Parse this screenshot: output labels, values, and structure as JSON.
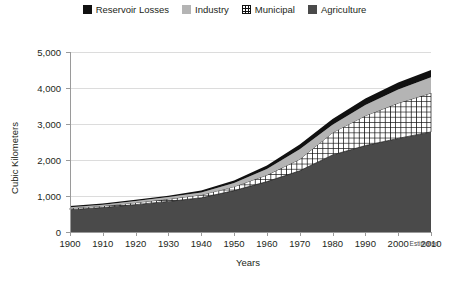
{
  "legend": {
    "position": "top-center",
    "items": [
      {
        "label": "Reservoir Losses",
        "icon": "square-swatch-black-icon",
        "color": "#111111",
        "pattern": "solid"
      },
      {
        "label": "Industry",
        "icon": "square-swatch-lightgray-icon",
        "color": "#b4b4b4",
        "pattern": "solid"
      },
      {
        "label": "Municipal",
        "icon": "square-swatch-crosshatch-icon",
        "color": "#ffffff",
        "pattern": "grid"
      },
      {
        "label": "Agriculture",
        "icon": "square-swatch-darkgray-icon",
        "color": "#4a4a4a",
        "pattern": "solid"
      }
    ]
  },
  "axes": {
    "x_title": "Years",
    "y_title": "Cubic Kilometers",
    "x_ticks": [
      "1900",
      "1910",
      "1920",
      "1930",
      "1940",
      "1950",
      "1960",
      "1970",
      "1980",
      "1990",
      "2000",
      "2010"
    ],
    "y_ticks": [
      "0",
      "1,000",
      "2,000",
      "3,000",
      "4,000",
      "5,000"
    ],
    "note": "Estimated"
  },
  "chart_data": {
    "type": "area",
    "title": "",
    "subtitle": "",
    "xlabel": "Years",
    "ylabel": "Cubic Kilometers",
    "xlim": [
      1900,
      2010
    ],
    "ylim": [
      0,
      5000
    ],
    "grid": true,
    "stacked": true,
    "legend_position": "top-center",
    "annotations": [
      "Estimated"
    ],
    "x": [
      1900,
      1910,
      1920,
      1930,
      1940,
      1950,
      1960,
      1970,
      1980,
      1990,
      2000,
      2010
    ],
    "x_tick_labels": [
      "1900",
      "1910",
      "1920",
      "1930",
      "1940",
      "1950",
      "1960",
      "1970",
      "1980",
      "1990",
      "2000",
      "2010"
    ],
    "y_tick_values": [
      0,
      1000,
      2000,
      3000,
      4000,
      5000
    ],
    "y_tick_labels": [
      "0",
      "1,000",
      "2,000",
      "3,000",
      "4,000",
      "5,000"
    ],
    "stack_order_bottom_to_top": [
      "Agriculture",
      "Municipal",
      "Industry",
      "Reservoir Losses"
    ],
    "series": [
      {
        "name": "Agriculture",
        "color": "#4a4a4a",
        "pattern": "solid",
        "values": [
          620,
          680,
          760,
          850,
          950,
          1150,
          1400,
          1700,
          2140,
          2400,
          2600,
          2780
        ]
      },
      {
        "name": "Municipal",
        "color": "#ffffff",
        "pattern": "grid",
        "values": [
          40,
          45,
          55,
          65,
          80,
          110,
          180,
          320,
          620,
          830,
          980,
          1080
        ]
      },
      {
        "name": "Industry",
        "color": "#b4b4b4",
        "pattern": "solid",
        "values": [
          30,
          35,
          45,
          55,
          70,
          100,
          170,
          280,
          220,
          300,
          380,
          440
        ]
      },
      {
        "name": "Reservoir Losses",
        "color": "#111111",
        "pattern": "solid",
        "values": [
          30,
          30,
          35,
          40,
          50,
          70,
          100,
          130,
          160,
          180,
          195,
          200
        ]
      }
    ],
    "cumulative_totals": [
      720,
      790,
      895,
      1010,
      1150,
      1430,
      1850,
      2430,
      3140,
      3710,
      4155,
      4500
    ]
  }
}
